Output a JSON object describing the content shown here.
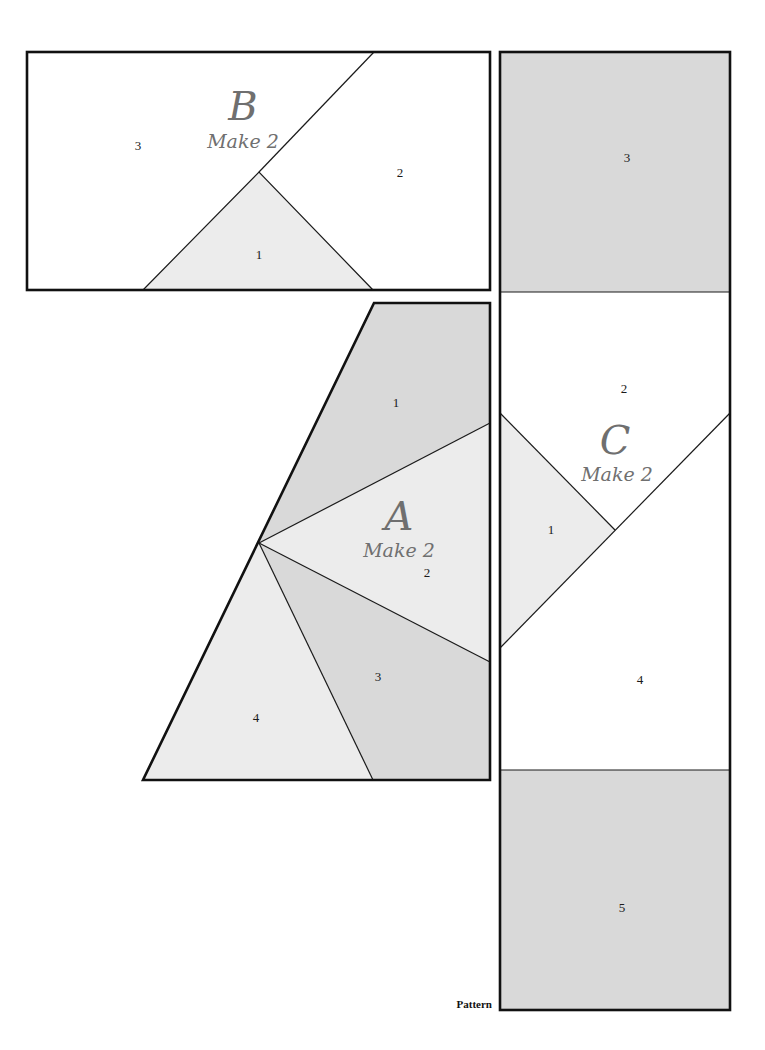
{
  "colors": {
    "white": "#ffffff",
    "light_gray": "#ececec",
    "medium_gray": "#d9d9d9",
    "outline": "#111111",
    "label_gray": "#6f6f6f"
  },
  "blocks": {
    "B": {
      "letter": "B",
      "instruction": "Make 2",
      "pieces": [
        {
          "number": "1",
          "shade": "light_gray"
        },
        {
          "number": "2",
          "shade": "white"
        },
        {
          "number": "3",
          "shade": "white"
        }
      ]
    },
    "A": {
      "letter": "A",
      "instruction": "Make 2",
      "pieces": [
        {
          "number": "1",
          "shade": "medium_gray"
        },
        {
          "number": "2",
          "shade": "light_gray"
        },
        {
          "number": "3",
          "shade": "medium_gray"
        },
        {
          "number": "4",
          "shade": "light_gray"
        }
      ]
    },
    "C": {
      "letter": "C",
      "instruction": "Make 2",
      "pieces": [
        {
          "number": "1",
          "shade": "light_gray"
        },
        {
          "number": "2",
          "shade": "white"
        },
        {
          "number": "3",
          "shade": "medium_gray"
        },
        {
          "number": "4",
          "shade": "white"
        },
        {
          "number": "5",
          "shade": "medium_gray"
        }
      ]
    }
  },
  "footer": {
    "label": "Pattern"
  }
}
